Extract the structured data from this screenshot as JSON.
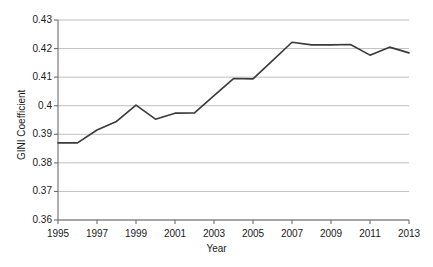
{
  "chart_data": {
    "type": "line",
    "title": "",
    "xlabel": "Year",
    "ylabel": "GINI Coefficient",
    "xlim": [
      1995,
      2013
    ],
    "ylim": [
      0.36,
      0.43
    ],
    "grid": true,
    "legend": false,
    "legend_position": "none",
    "line_color": "#3a3a3a",
    "x": [
      1995,
      1996,
      1997,
      1998,
      1999,
      2000,
      2001,
      2002,
      2003,
      2004,
      2005,
      2006,
      2007,
      2008,
      2009,
      2010,
      2011,
      2012,
      2013
    ],
    "values": [
      0.387,
      0.387,
      0.3915,
      0.3945,
      0.4002,
      0.3953,
      0.3974,
      0.3975,
      0.4035,
      0.4095,
      0.4094,
      0.4158,
      0.4222,
      0.4213,
      0.4213,
      0.4214,
      0.4177,
      0.4205,
      0.4185
    ],
    "series": [
      {
        "name": "GINI Coefficient",
        "values": [
          0.387,
          0.387,
          0.3915,
          0.3945,
          0.4002,
          0.3953,
          0.3974,
          0.3975,
          0.4035,
          0.4095,
          0.4094,
          0.4158,
          0.4222,
          0.4213,
          0.4213,
          0.4214,
          0.4177,
          0.4205,
          0.4185
        ]
      }
    ],
    "y_ticks": [
      0.43,
      0.42,
      0.41,
      0.4,
      0.39,
      0.38,
      0.37,
      0.36
    ],
    "y_tick_labels": [
      "0.43",
      "0.42",
      "0.41",
      "0.4",
      "0.39",
      "0.38",
      "0.37",
      "0.36"
    ],
    "x_ticks": [
      1995,
      1997,
      1999,
      2001,
      2003,
      2005,
      2007,
      2009,
      2011,
      2013
    ],
    "x_tick_labels": [
      "1995",
      "1997",
      "1999",
      "2001",
      "2003",
      "2005",
      "2007",
      "2009",
      "2011",
      "2013"
    ]
  }
}
